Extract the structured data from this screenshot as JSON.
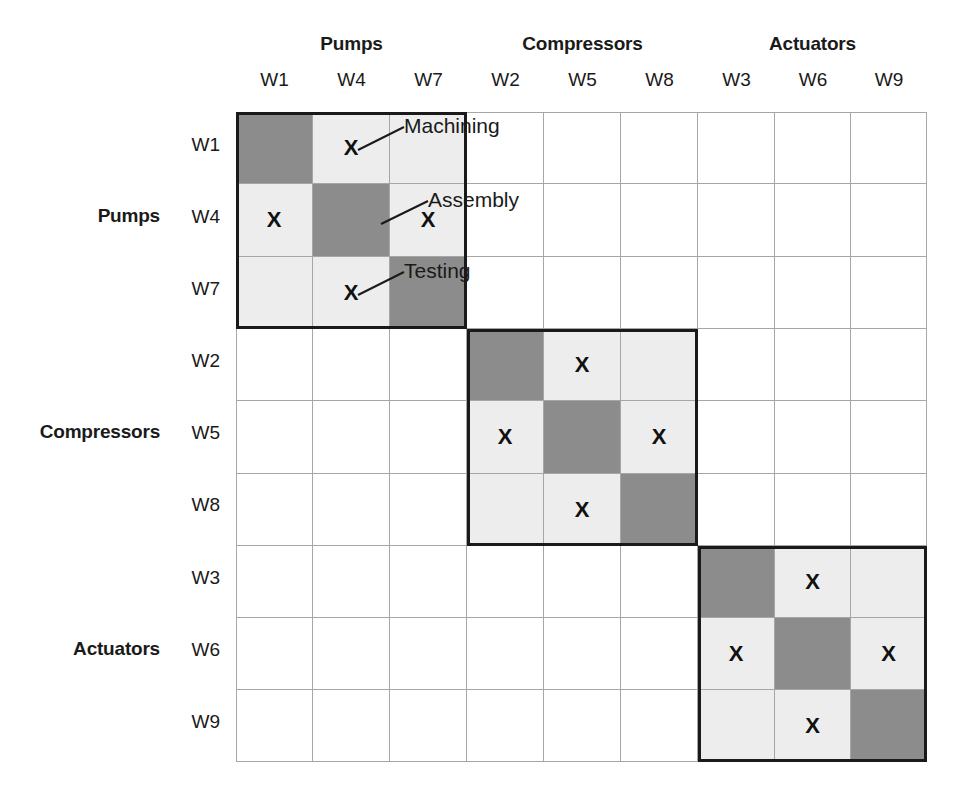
{
  "groups": {
    "columns": [
      {
        "label": "Pumps",
        "members": [
          "W1",
          "W4",
          "W7"
        ]
      },
      {
        "label": "Compressors",
        "members": [
          "W2",
          "W5",
          "W8"
        ]
      },
      {
        "label": "Actuators",
        "members": [
          "W3",
          "W6",
          "W9"
        ]
      }
    ],
    "rows": [
      {
        "label": "Pumps",
        "members": [
          "W1",
          "W4",
          "W7"
        ]
      },
      {
        "label": "Compressors",
        "members": [
          "W2",
          "W5",
          "W8"
        ]
      },
      {
        "label": "Actuators",
        "members": [
          "W3",
          "W6",
          "W9"
        ]
      }
    ]
  },
  "column_headers": [
    "W1",
    "W4",
    "W7",
    "W2",
    "W5",
    "W8",
    "W3",
    "W6",
    "W9"
  ],
  "row_headers": [
    "W1",
    "W4",
    "W7",
    "W2",
    "W5",
    "W8",
    "W3",
    "W6",
    "W9"
  ],
  "annotations": [
    {
      "text": "Machining",
      "target_row": "W1",
      "target_col": "W4"
    },
    {
      "text": "Assembly",
      "target_row": "W4",
      "target_col": "W4"
    },
    {
      "text": "Testing",
      "target_row": "W7",
      "target_col": "W7"
    }
  ],
  "legend": {
    "diagonal_fill": "#8c8c8c",
    "in_block_fill": "#ededed",
    "out_block_fill": "#ffffff",
    "block_border": "#1a1a1a",
    "grid_line": "#a6a6a6",
    "mark_symbol": "X"
  },
  "chart_data": {
    "type": "heatmap",
    "xlabel": "",
    "ylabel": "",
    "x": [
      "W1",
      "W4",
      "W7",
      "W2",
      "W5",
      "W8",
      "W3",
      "W6",
      "W9"
    ],
    "y": [
      "W1",
      "W4",
      "W7",
      "W2",
      "W5",
      "W8",
      "W3",
      "W6",
      "W9"
    ],
    "x_groups": [
      "Pumps",
      "Pumps",
      "Pumps",
      "Compressors",
      "Compressors",
      "Compressors",
      "Actuators",
      "Actuators",
      "Actuators"
    ],
    "y_groups": [
      "Pumps",
      "Pumps",
      "Pumps",
      "Compressors",
      "Compressors",
      "Compressors",
      "Actuators",
      "Actuators",
      "Actuators"
    ],
    "legend_position": "none",
    "grid": true,
    "cell_states": [
      [
        "diagonal",
        "mark",
        "in-block",
        "empty",
        "empty",
        "empty",
        "empty",
        "empty",
        "empty"
      ],
      [
        "mark",
        "diagonal",
        "mark",
        "empty",
        "empty",
        "empty",
        "empty",
        "empty",
        "empty"
      ],
      [
        "in-block",
        "mark",
        "diagonal",
        "empty",
        "empty",
        "empty",
        "empty",
        "empty",
        "empty"
      ],
      [
        "empty",
        "empty",
        "empty",
        "diagonal",
        "mark",
        "in-block",
        "empty",
        "empty",
        "empty"
      ],
      [
        "empty",
        "empty",
        "empty",
        "mark",
        "diagonal",
        "mark",
        "empty",
        "empty",
        "empty"
      ],
      [
        "empty",
        "empty",
        "empty",
        "in-block",
        "mark",
        "diagonal",
        "empty",
        "empty",
        "empty"
      ],
      [
        "empty",
        "empty",
        "empty",
        "empty",
        "empty",
        "empty",
        "diagonal",
        "mark",
        "in-block"
      ],
      [
        "empty",
        "empty",
        "empty",
        "empty",
        "empty",
        "empty",
        "mark",
        "diagonal",
        "mark"
      ],
      [
        "empty",
        "empty",
        "empty",
        "empty",
        "empty",
        "empty",
        "in-block",
        "mark",
        "diagonal"
      ]
    ],
    "values": [
      [
        2,
        1,
        0,
        0,
        0,
        0,
        0,
        0,
        0
      ],
      [
        1,
        2,
        1,
        0,
        0,
        0,
        0,
        0,
        0
      ],
      [
        0,
        1,
        2,
        0,
        0,
        0,
        0,
        0,
        0
      ],
      [
        0,
        0,
        0,
        2,
        1,
        0,
        0,
        0,
        0
      ],
      [
        0,
        0,
        0,
        1,
        2,
        1,
        0,
        0,
        0
      ],
      [
        0,
        0,
        0,
        0,
        1,
        2,
        0,
        0,
        0
      ],
      [
        0,
        0,
        0,
        0,
        0,
        0,
        2,
        1,
        0
      ],
      [
        0,
        0,
        0,
        0,
        0,
        0,
        1,
        2,
        1
      ],
      [
        0,
        0,
        0,
        0,
        0,
        0,
        0,
        1,
        2
      ]
    ],
    "blocks": [
      {
        "name": "Pumps",
        "rows": [
          "W1",
          "W4",
          "W7"
        ],
        "cols": [
          "W1",
          "W4",
          "W7"
        ]
      },
      {
        "name": "Compressors",
        "rows": [
          "W2",
          "W5",
          "W8"
        ],
        "cols": [
          "W2",
          "W5",
          "W8"
        ]
      },
      {
        "name": "Actuators",
        "rows": [
          "W3",
          "W6",
          "W9"
        ],
        "cols": [
          "W3",
          "W6",
          "W9"
        ]
      }
    ]
  }
}
